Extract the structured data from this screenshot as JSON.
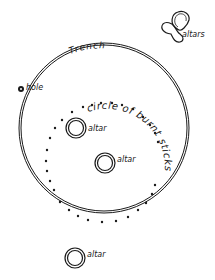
{
  "diagram": {
    "labels": {
      "trench": "Trench",
      "hole": "hole",
      "circle_text": "circle of burnt sticks",
      "altar_1": "altar",
      "altar_2": "altar",
      "altar_3": "altar",
      "altars_group": "altars"
    },
    "colors": {
      "ink": "#1a1a1a",
      "background": "#ffffff"
    }
  }
}
